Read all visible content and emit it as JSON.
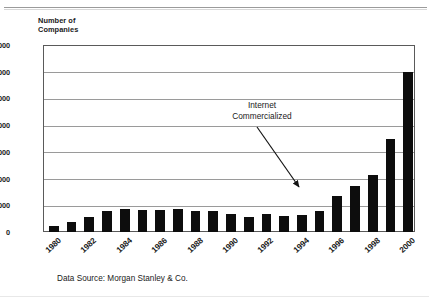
{
  "chart_data": {
    "type": "bar",
    "title": "",
    "subtitle": "",
    "xlabel": "",
    "ylabel": "Number of\nCompanies",
    "ylim": [
      0,
      7000
    ],
    "ytick_labels": [
      "7,000",
      "6,000",
      "5,000",
      "4,000",
      "3,000",
      "2,000",
      "1,000",
      "0"
    ],
    "ytick_values": [
      7000,
      6000,
      5000,
      4000,
      3000,
      2000,
      1000,
      0
    ],
    "grid": "horizontal",
    "legend": "none",
    "bar_color": "#0d0d0d",
    "categories": [
      "1980",
      "1981",
      "1982",
      "1983",
      "1984",
      "1985",
      "1986",
      "1987",
      "1988",
      "1989",
      "1990",
      "1991",
      "1992",
      "1993",
      "1994",
      "1995",
      "1996",
      "1997",
      "1998",
      "1999",
      "2000"
    ],
    "xtick_labels_shown": [
      "1980",
      "1982",
      "1984",
      "1986",
      "1988",
      "1990",
      "1992",
      "1994",
      "1996",
      "1998",
      "2000"
    ],
    "values": [
      210,
      390,
      560,
      780,
      880,
      820,
      830,
      860,
      790,
      770,
      660,
      580,
      670,
      605,
      630,
      790,
      1350,
      1710,
      2150,
      3500,
      6000
    ],
    "annotations": [
      {
        "text": "Internet\nCommercialized",
        "points_to_year": "1995",
        "arrow_direction": "down-right"
      }
    ],
    "caption": "Data Source: Morgan Stanley & Co."
  },
  "figure": {
    "axis_title": "Number of\nCompanies",
    "annotation": "Internet\nCommercialized",
    "caption": "Data Source: Morgan Stanley & Co."
  }
}
